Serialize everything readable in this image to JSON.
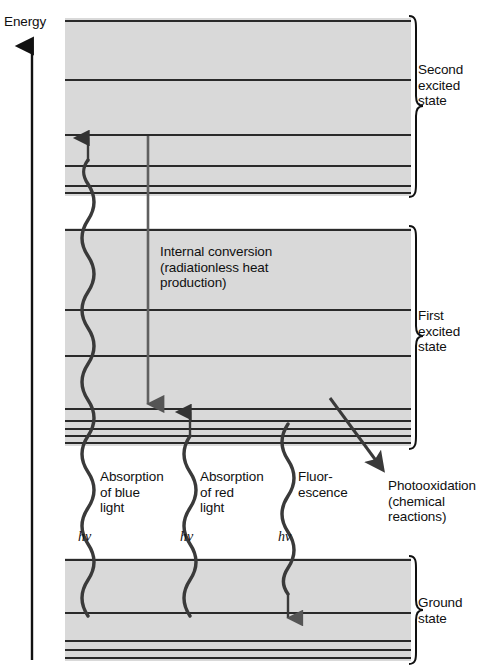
{
  "diagram": {
    "axis": {
      "label": "Energy",
      "direction": "up"
    },
    "colors": {
      "band_fill": "#d9d9d9",
      "level_line": "#2a2a2a",
      "arrow": "#3a3a3a",
      "text": "#101010",
      "background": "#ffffff"
    },
    "states": [
      {
        "name": "second-excited-state",
        "bracket_label": "Second\nexcited\nstate",
        "band_top": 18,
        "band_bottom": 196,
        "levels": [
          22,
          80,
          135,
          166,
          186,
          193
        ]
      },
      {
        "name": "first-excited-state",
        "bracket_label": "First\nexcited\nstate",
        "band_top": 228,
        "band_bottom": 446,
        "levels": [
          230,
          310,
          356,
          409,
          421,
          429,
          436,
          443
        ]
      },
      {
        "name": "ground-state",
        "bracket_label": "Ground\nstate",
        "band_top": 558,
        "band_bottom": 661,
        "levels": [
          560,
          613,
          641,
          650,
          657
        ]
      }
    ],
    "transitions": [
      {
        "name": "absorption-blue",
        "label": "Absorption\nof blue\nlight",
        "photon_label": "hv",
        "type": "wavy",
        "x": 88,
        "y_start": 613,
        "y_end": 136,
        "arrowhead": "up"
      },
      {
        "name": "absorption-red",
        "label": "Absorption\nof red\nlight",
        "photon_label": "hv",
        "type": "wavy",
        "x": 190,
        "y_start": 613,
        "y_end": 410,
        "arrowhead": "up"
      },
      {
        "name": "fluorescence",
        "label": "Fluor-\nescence",
        "photon_label": "hv",
        "type": "wavy",
        "x": 288,
        "y_start": 424,
        "y_end": 620,
        "arrowhead": "down"
      },
      {
        "name": "internal-conversion",
        "label": "Internal conversion\n(radiationless heat\nproduction)",
        "type": "straight",
        "x": 148,
        "y_start": 136,
        "y_end": 414,
        "arrowhead": "down"
      },
      {
        "name": "photooxidation",
        "label": "Photooxidation\n(chemical\nreactions)",
        "type": "diagonal",
        "x_start": 330,
        "y_start": 398,
        "x_end": 384,
        "y_end": 472,
        "arrowhead": "down-right"
      }
    ]
  }
}
